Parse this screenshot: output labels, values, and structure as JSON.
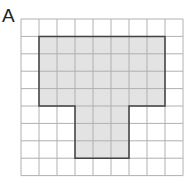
{
  "figure": {
    "label": "A",
    "grid": {
      "cols": 9,
      "rows": 9,
      "line_color": "#b0b0b0"
    },
    "shape": {
      "fill": "#e3e3e3",
      "stroke": "#444444",
      "cells_description": "T-shape: rows 1-4 cols 1-7, rows 5-7 cols 3-5"
    }
  }
}
